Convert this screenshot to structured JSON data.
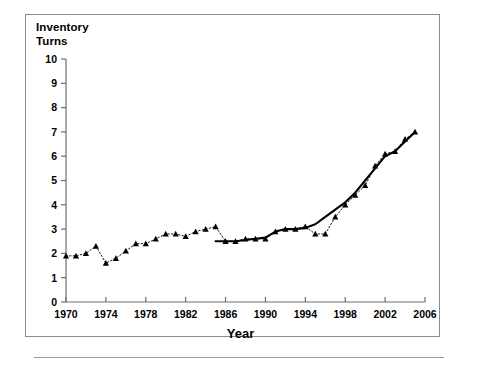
{
  "figure": {
    "background_color": "#ffffff",
    "frame_color": "#8c8c8c",
    "axis_color": "#6e6e6e",
    "series_color": "#000000"
  },
  "labels": {
    "y_axis_title_line1": "Inventory",
    "y_axis_title_line2": "Turns",
    "x_axis_title": "Year"
  },
  "chart_data": {
    "type": "line",
    "title": "",
    "xlabel": "Year",
    "ylabel": "Inventory Turns",
    "xlim": [
      1970,
      2006
    ],
    "ylim": [
      0,
      10
    ],
    "xticks": [
      1970,
      1974,
      1978,
      1982,
      1986,
      1990,
      1994,
      1998,
      2002,
      2006
    ],
    "xtick_labels": [
      "1970",
      "1974",
      "1978",
      "1982",
      "1986",
      "1990",
      "1994",
      "1998",
      "2002",
      "2006"
    ],
    "yticks": [
      0,
      1,
      2,
      3,
      4,
      5,
      6,
      7,
      8,
      9,
      10
    ],
    "ytick_labels": [
      "0",
      "1",
      "2",
      "3",
      "4",
      "5",
      "6",
      "7",
      "8",
      "9",
      "10"
    ],
    "grid": false,
    "legend": null,
    "legend_position": "none",
    "series": [
      {
        "name": "Annual inventory turns (markers)",
        "style": "dotted-line-with-triangle-markers",
        "marker": "triangle",
        "x": [
          1970,
          1971,
          1972,
          1973,
          1974,
          1975,
          1976,
          1977,
          1978,
          1979,
          1980,
          1981,
          1982,
          1983,
          1984,
          1985,
          1986,
          1987,
          1988,
          1989,
          1990,
          1991,
          1992,
          1993,
          1994,
          1995,
          1996,
          1997,
          1998,
          1999,
          2000,
          2001,
          2002,
          2003,
          2004,
          2005
        ],
        "values": [
          1.9,
          1.9,
          2.0,
          2.3,
          1.6,
          1.8,
          2.1,
          2.4,
          2.4,
          2.6,
          2.8,
          2.8,
          2.7,
          2.9,
          3.0,
          3.1,
          2.5,
          2.5,
          2.6,
          2.6,
          2.6,
          2.9,
          3.0,
          3.0,
          3.1,
          2.8,
          2.8,
          3.5,
          4.0,
          4.4,
          4.8,
          5.6,
          6.1,
          6.2,
          6.7,
          7.0
        ]
      },
      {
        "name": "Smoothed trend (solid)",
        "style": "solid-line",
        "marker": "none",
        "x": [
          1985,
          1986,
          1987,
          1988,
          1989,
          1990,
          1991,
          1992,
          1993,
          1994,
          1995,
          1996,
          1997,
          1998,
          1999,
          2000,
          2001,
          2002,
          2003,
          2004,
          2005
        ],
        "values": [
          2.5,
          2.5,
          2.5,
          2.55,
          2.6,
          2.65,
          2.9,
          3.0,
          3.0,
          3.05,
          3.2,
          3.5,
          3.8,
          4.1,
          4.5,
          5.0,
          5.5,
          6.0,
          6.2,
          6.6,
          7.0
        ]
      }
    ]
  }
}
